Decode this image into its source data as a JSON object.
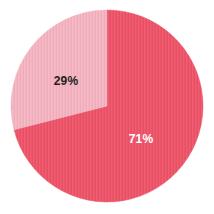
{
  "chart_data": {
    "type": "pie",
    "title": "",
    "subtitle": "",
    "xlabel": "",
    "ylabel": "",
    "grid": false,
    "legend": false,
    "legend_position": "none",
    "start_angle_deg": 0,
    "direction": "clockwise",
    "center": {
      "x": 107,
      "y": 106
    },
    "radius": 96,
    "background_color": "#ffffff",
    "categories": [
      "71%",
      "29%"
    ],
    "values": [
      71,
      29
    ],
    "slices": [
      {
        "label": "71%",
        "value": 71,
        "color": "#ee5368",
        "label_color": "#ffffff",
        "start_deg": 0,
        "end_deg": 255.6,
        "label_x": 141,
        "label_y": 139
      },
      {
        "label": "29%",
        "value": 29,
        "color": "#f5b4c1",
        "label_color": "#231f20",
        "start_deg": 255.6,
        "end_deg": 360,
        "label_x": 66,
        "label_y": 81
      }
    ],
    "colors": [
      "#ee5368",
      "#f5b4c1"
    ],
    "annotations": []
  }
}
